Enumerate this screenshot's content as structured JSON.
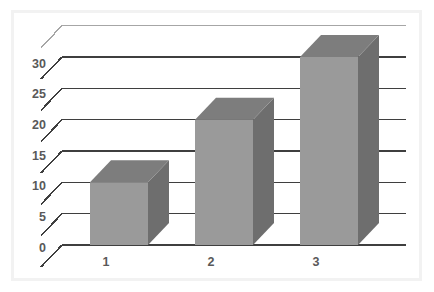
{
  "chart": {
    "title": "",
    "background_color": "#ffffff",
    "frame_color": "#f2f2f2",
    "gridline_color": "#3f3f3f",
    "top_gridline_color": "#a6a6a6",
    "bar_front_color": "#9a9a9a",
    "bar_side_color": "#6e6e6e",
    "bar_top_color": "#7d7d7d",
    "label_color": "#595959"
  },
  "chart_data": {
    "type": "bar",
    "style": "3d-column",
    "title": "",
    "xlabel": "",
    "ylabel": "",
    "categories": [
      "1",
      "2",
      "3"
    ],
    "values": [
      10,
      20,
      30
    ],
    "series": [
      {
        "name": "Series 1",
        "values": [
          10,
          20,
          30
        ]
      }
    ],
    "ylim": [
      0,
      35
    ],
    "ytick_interval": 5,
    "ytick_labels": [
      "0",
      "5",
      "10",
      "15",
      "20",
      "25",
      "30"
    ],
    "ytick_values": [
      0,
      5,
      10,
      15,
      20,
      25,
      30
    ],
    "xtick_labels": [
      "1",
      "2",
      "3"
    ],
    "grid": true,
    "grid_axis": "y",
    "legend": false,
    "legend_position": "none"
  },
  "axis": {
    "y_ticks": [
      {
        "label": "30",
        "value": 30
      },
      {
        "label": "25",
        "value": 25
      },
      {
        "label": "20",
        "value": 20
      },
      {
        "label": "15",
        "value": 15
      },
      {
        "label": "10",
        "value": 10
      },
      {
        "label": "5",
        "value": 5
      },
      {
        "label": "0",
        "value": 0
      }
    ],
    "x_ticks": [
      {
        "label": "1"
      },
      {
        "label": "2"
      },
      {
        "label": "3"
      }
    ]
  }
}
